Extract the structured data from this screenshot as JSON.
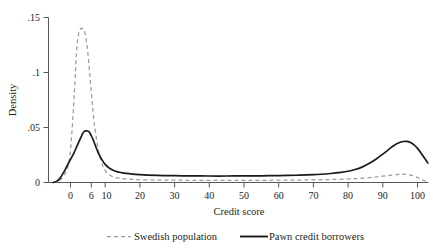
{
  "chart_data": {
    "type": "line",
    "title": "",
    "subtitle": "",
    "xlabel": "Credit score",
    "ylabel": "Density",
    "xlim": [
      -8,
      105
    ],
    "ylim": [
      0,
      0.155
    ],
    "grid": false,
    "legend_position": "below-axes",
    "xticks": [
      0,
      6,
      10,
      20,
      30,
      40,
      50,
      60,
      70,
      80,
      90,
      100
    ],
    "xtick_labels": [
      "0",
      "6",
      "10",
      "20",
      "30",
      "40",
      "50",
      "60",
      "70",
      "80",
      "90",
      "100"
    ],
    "yticks": [
      0,
      0.05,
      0.1,
      0.15
    ],
    "ytick_labels": [
      "0",
      ".05",
      ".1",
      ".15"
    ],
    "series": [
      {
        "name": "Swedish population",
        "style": "dashed",
        "color": "#9a9a9a",
        "x": [
          -5,
          -3,
          -1,
          0,
          1,
          1.5,
          2,
          2.5,
          3,
          3.5,
          4,
          4.5,
          5,
          5.5,
          6,
          6.5,
          7,
          8,
          9,
          10,
          11,
          12,
          13,
          14,
          15,
          17,
          20,
          25,
          30,
          35,
          40,
          45,
          50,
          55,
          60,
          65,
          70,
          75,
          80,
          83,
          86,
          88,
          90,
          92,
          94,
          95,
          96,
          97,
          98,
          99,
          100,
          101,
          102,
          103
        ],
        "y": [
          0.0,
          0.002,
          0.012,
          0.03,
          0.075,
          0.105,
          0.128,
          0.137,
          0.14,
          0.14,
          0.138,
          0.13,
          0.118,
          0.1,
          0.082,
          0.064,
          0.05,
          0.03,
          0.018,
          0.011,
          0.0075,
          0.0055,
          0.0045,
          0.004,
          0.0035,
          0.003,
          0.0025,
          0.0022,
          0.0021,
          0.002,
          0.002,
          0.002,
          0.002,
          0.002,
          0.0021,
          0.0022,
          0.0024,
          0.0027,
          0.0032,
          0.0037,
          0.0044,
          0.005,
          0.0057,
          0.0065,
          0.0072,
          0.0075,
          0.0076,
          0.0074,
          0.0068,
          0.0058,
          0.0045,
          0.003,
          0.0016,
          0.0006
        ]
      },
      {
        "name": "Pawn credit borrowers",
        "style": "solid",
        "color": "#1a1a1a",
        "x": [
          -5,
          -4,
          -3,
          -2,
          -1,
          0,
          1,
          2,
          3,
          3.5,
          4,
          4.5,
          5,
          5.5,
          6,
          6.5,
          7,
          8,
          9,
          10,
          11,
          12,
          13,
          14,
          15,
          17,
          20,
          25,
          30,
          35,
          40,
          45,
          50,
          55,
          60,
          65,
          70,
          75,
          78,
          80,
          82,
          84,
          86,
          88,
          90,
          92,
          93,
          94,
          95,
          96,
          97,
          98,
          99,
          100,
          101,
          102,
          103
        ],
        "y": [
          0.0,
          0.001,
          0.004,
          0.009,
          0.015,
          0.021,
          0.027,
          0.034,
          0.041,
          0.0445,
          0.0465,
          0.047,
          0.0468,
          0.0455,
          0.0425,
          0.039,
          0.035,
          0.027,
          0.021,
          0.0165,
          0.0135,
          0.0115,
          0.0102,
          0.0094,
          0.0088,
          0.008,
          0.0072,
          0.0065,
          0.0062,
          0.006,
          0.0059,
          0.0059,
          0.006,
          0.0061,
          0.0063,
          0.0066,
          0.0071,
          0.0082,
          0.0092,
          0.0102,
          0.0118,
          0.014,
          0.0172,
          0.0212,
          0.0258,
          0.0308,
          0.0332,
          0.0352,
          0.0366,
          0.0373,
          0.0374,
          0.0364,
          0.0342,
          0.031,
          0.0268,
          0.0222,
          0.0178
        ]
      }
    ]
  },
  "axes": {
    "y_axis_title": "Density",
    "x_axis_title": "Credit score"
  },
  "legend": {
    "entries": [
      {
        "label": "Swedish population",
        "style": "dashed"
      },
      {
        "label": "Pawn credit borrowers",
        "style": "solid"
      }
    ]
  }
}
